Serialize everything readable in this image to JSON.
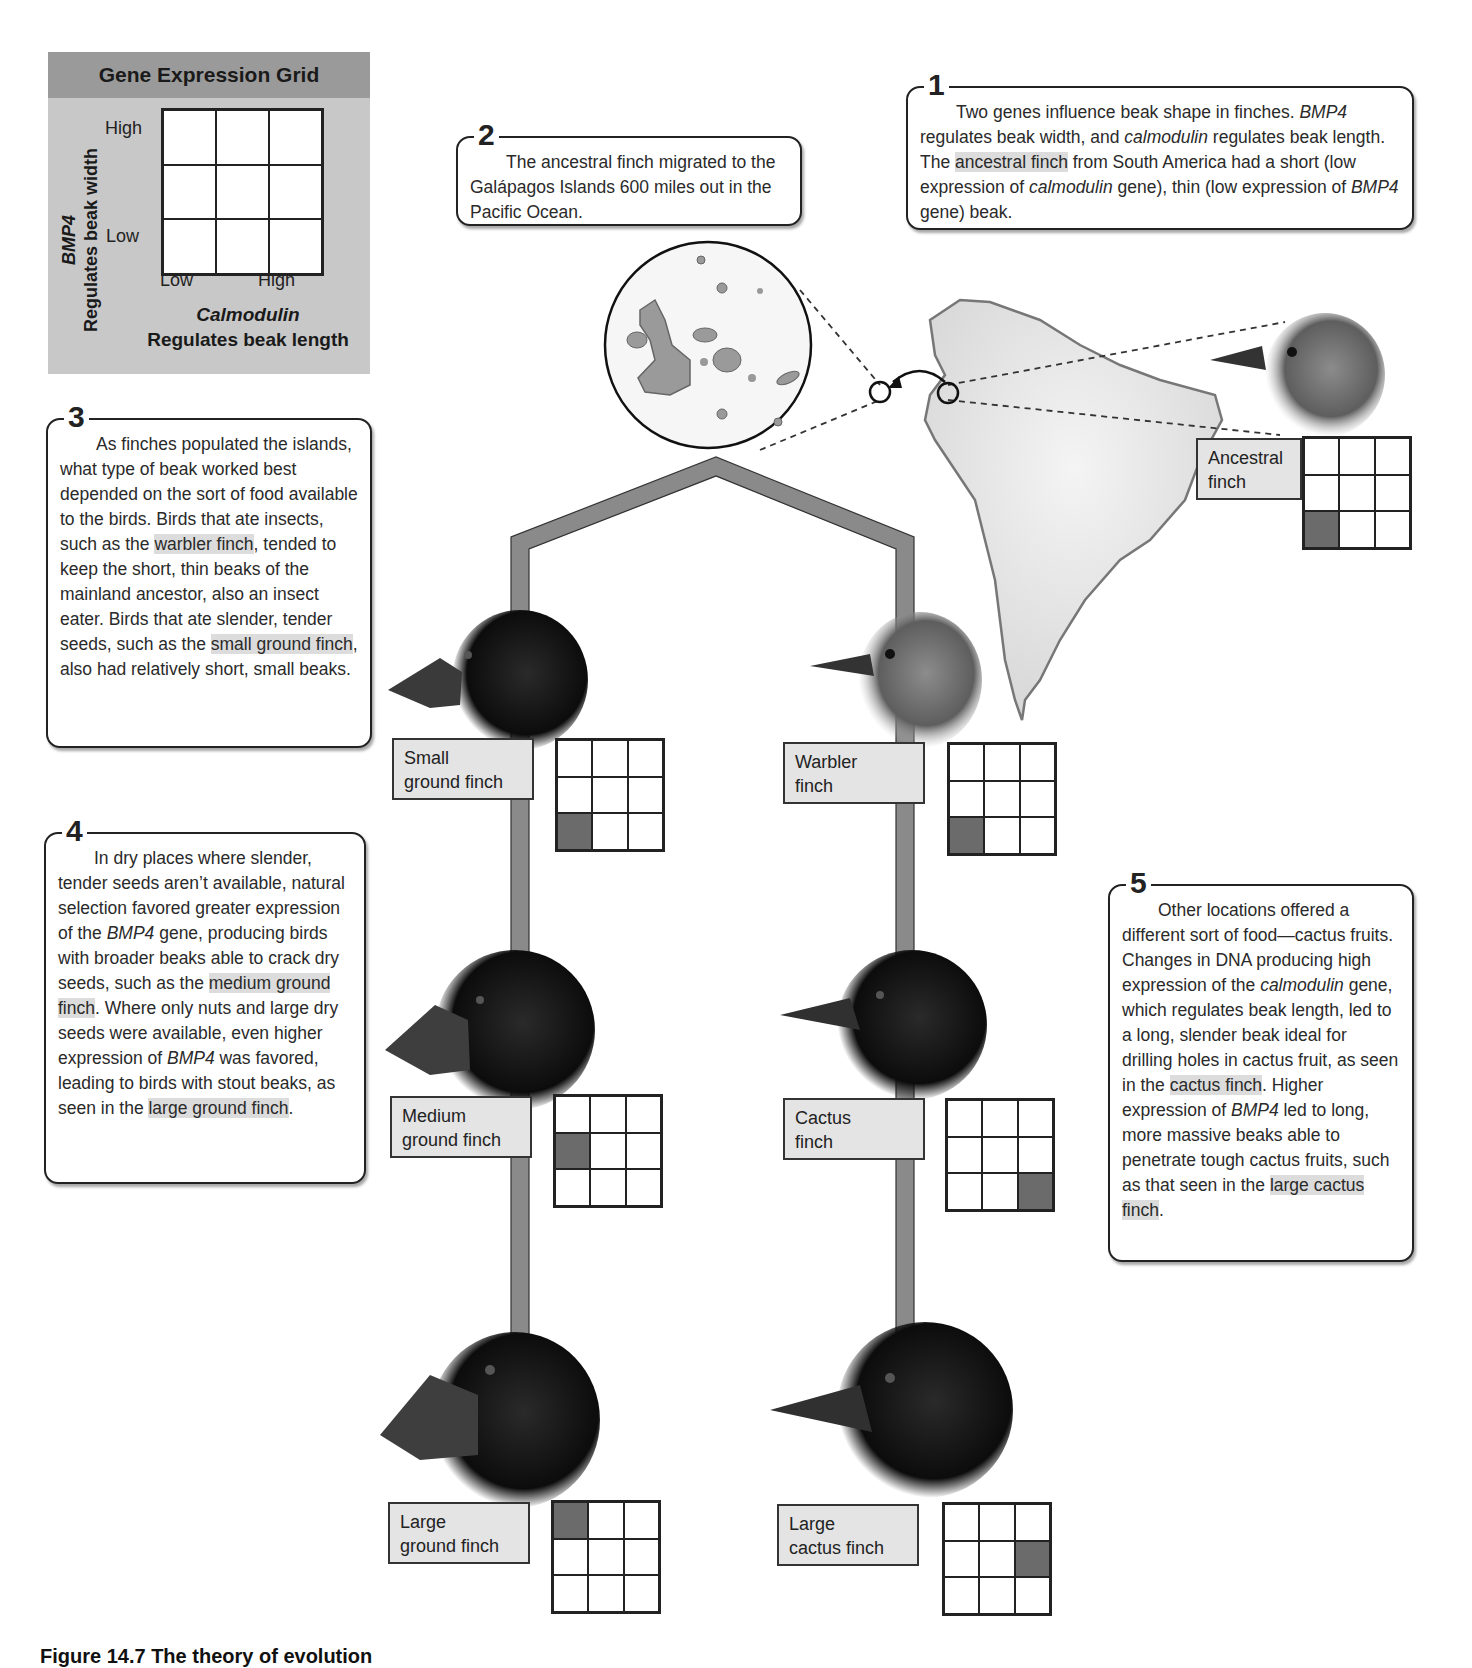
{
  "legend": {
    "title": "Gene Expression Grid",
    "y_gene": "BMP4",
    "y_desc": "Regulates beak width",
    "y_high": "High",
    "y_low": "Low",
    "x_gene": "Calmodulin",
    "x_desc": "Regulates beak length",
    "x_low": "Low",
    "x_high": "High"
  },
  "callouts": {
    "c1": {
      "number": "1",
      "t1": "Two genes influence beak shape in finches. ",
      "g1": "BMP4",
      "t2": " regulates beak width, and ",
      "g2": "calmodulin",
      "t3": " regulates beak length. The ",
      "hl": "ancestral finch",
      "t4": " from South America had a short (low expression of ",
      "g3": "calmodulin",
      "t5": " gene), thin (low expression of ",
      "g4": "BMP4",
      "t6": " gene) beak."
    },
    "c2": {
      "number": "2",
      "text": "The ancestral finch migrated to the Galápagos Islands 600 miles out in the Pacific Ocean."
    },
    "c3": {
      "number": "3",
      "t1": "As finches populated the islands, what type of beak worked best depended on the sort of food available to the birds. Birds that ate insects, such as the ",
      "hl1": "warbler finch",
      "t2": ", tended to keep the short, thin beaks of the mainland ancestor, also an insect eater. Birds that ate slender, tender seeds, such as the ",
      "hl2": "small ground finch",
      "t3": ", also had relatively short, small beaks."
    },
    "c4": {
      "number": "4",
      "t1": "In dry places where slender, tender seeds aren’t available, natural selection favored greater expression of the ",
      "g1": "BMP4",
      "t2": " gene, producing birds with broader beaks able to crack dry seeds, such as the ",
      "hl1": "medium ground finch",
      "t3": ". Where only nuts and large dry seeds were available, even higher expression of ",
      "g2": "BMP4",
      "t4": " was favored, leading to birds with stout beaks, as seen in the ",
      "hl2": "large ground finch",
      "t5": "."
    },
    "c5": {
      "number": "5",
      "t1": "Other locations offered a different sort of food—cactus fruits. Changes in DNA producing high expression of the ",
      "g1": "calmodulin",
      "t2": " gene, which regulates beak length, led to a long, slender beak ideal for drilling holes in cactus fruit, as seen in the ",
      "hl1": "cactus finch",
      "t3": ". Higher expression of ",
      "g2": "BMP4",
      "t4": " led to long, more massive beaks able to penetrate tough cactus fruits, such as that seen in the ",
      "hl2": "large cactus finch",
      "t5": "."
    }
  },
  "species": [
    {
      "id": "ancestral",
      "line1": "Ancestral",
      "line2": "finch",
      "active_cell": [
        2,
        0
      ]
    },
    {
      "id": "small-ground",
      "line1": "Small",
      "line2": "ground finch",
      "active_cell": [
        2,
        0
      ]
    },
    {
      "id": "warbler",
      "line1": "Warbler",
      "line2": "finch",
      "active_cell": [
        2,
        0
      ]
    },
    {
      "id": "medium-ground",
      "line1": "Medium",
      "line2": "ground finch",
      "active_cell": [
        1,
        0
      ]
    },
    {
      "id": "cactus",
      "line1": "Cactus",
      "line2": "finch",
      "active_cell": [
        2,
        2
      ]
    },
    {
      "id": "large-ground",
      "line1": "Large",
      "line2": "ground finch",
      "active_cell": [
        0,
        0
      ]
    },
    {
      "id": "large-cactus",
      "line1": "Large",
      "line2": "cactus finch",
      "active_cell": [
        1,
        2
      ]
    }
  ],
  "colors": {
    "grid_active": "#6b6b6b",
    "legend_bg": "#c8c8c8",
    "legend_header": "#9a9a9a",
    "tree_branch": "#8a8a8a",
    "highlight": "#dcdcdc"
  },
  "caption": "Figure 14.7  The theory of evolution"
}
